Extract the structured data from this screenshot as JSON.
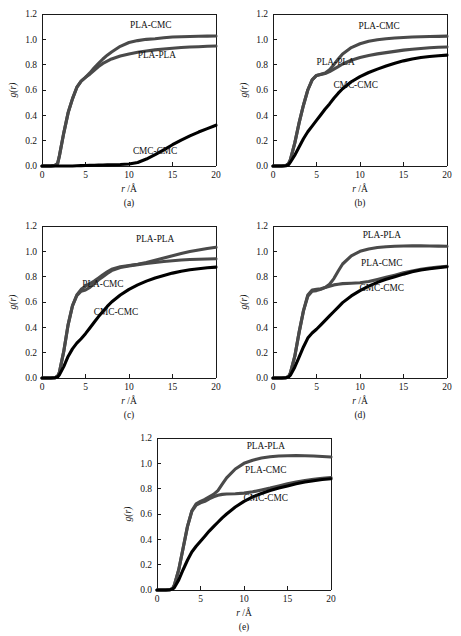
{
  "figure": {
    "axis_color": "#1a1a1a",
    "background": "#ffffff",
    "series_colors": {
      "PLA-PLA": "#4a4a4a",
      "PLA-CMC": "#4a4a4a",
      "CMC-CMC": "#000000"
    },
    "xlabel": "r /Å",
    "ylabel": "g(r)",
    "xticklabels": [
      "0",
      "5",
      "10",
      "15",
      "20"
    ],
    "yticklabels": [
      "0.0",
      "0.2",
      "0.4",
      "0.6",
      "0.8",
      "1.0",
      "1.2"
    ],
    "panel_labels": [
      "(a)",
      "(b)",
      "(c)",
      "(d)",
      "(e)"
    ]
  },
  "chart_data": [
    {
      "type": "line",
      "title": "(a)",
      "xlabel": "r /Å",
      "ylabel": "g(r)",
      "xlim": [
        0,
        20
      ],
      "ylim": [
        0,
        1.2
      ],
      "xticks": [
        0,
        5,
        10,
        15,
        20
      ],
      "yticks": [
        0.0,
        0.2,
        0.4,
        0.6,
        0.8,
        1.0,
        1.2
      ],
      "grid": false,
      "legend": "inline-annotations",
      "x": [
        0,
        1,
        1.5,
        1.8,
        2,
        2.5,
        3,
        3.5,
        4,
        4.5,
        5,
        5.5,
        6,
        6.5,
        7,
        7.5,
        8,
        9,
        10,
        11,
        12,
        13,
        14,
        15,
        16,
        17,
        18,
        19,
        20
      ],
      "series": [
        {
          "name": "PLA-CMC",
          "values": [
            0,
            0,
            0.005,
            0.02,
            0.08,
            0.26,
            0.42,
            0.53,
            0.62,
            0.67,
            0.7,
            0.735,
            0.775,
            0.81,
            0.845,
            0.875,
            0.9,
            0.945,
            0.975,
            0.99,
            1.0,
            1.005,
            1.012,
            1.018,
            1.02,
            1.022,
            1.024,
            1.025,
            1.026
          ],
          "label_at": [
            12.5,
            1.09
          ]
        },
        {
          "name": "PLA-PLA",
          "values": [
            0,
            0,
            0.005,
            0.02,
            0.08,
            0.26,
            0.42,
            0.53,
            0.62,
            0.67,
            0.7,
            0.725,
            0.755,
            0.785,
            0.81,
            0.828,
            0.845,
            0.868,
            0.885,
            0.898,
            0.908,
            0.917,
            0.924,
            0.93,
            0.935,
            0.939,
            0.942,
            0.945,
            0.947
          ],
          "label_at": [
            13.2,
            0.855
          ]
        },
        {
          "name": "CMC-CMC",
          "values": [
            0,
            0,
            0,
            0,
            0,
            0,
            0,
            0,
            0.002,
            0.003,
            0.004,
            0.005,
            0.006,
            0.007,
            0.008,
            0.009,
            0.01,
            0.012,
            0.016,
            0.028,
            0.055,
            0.09,
            0.128,
            0.168,
            0.205,
            0.238,
            0.268,
            0.295,
            0.322
          ],
          "label_at": [
            13.0,
            0.095
          ]
        }
      ]
    },
    {
      "type": "line",
      "title": "(b)",
      "xlabel": "r /Å",
      "ylabel": "g(r)",
      "xlim": [
        0,
        20
      ],
      "ylim": [
        0,
        1.2
      ],
      "xticks": [
        0,
        5,
        10,
        15,
        20
      ],
      "yticks": [
        0.0,
        0.2,
        0.4,
        0.6,
        0.8,
        1.0,
        1.2
      ],
      "grid": false,
      "legend": "inline-annotations",
      "x": [
        0,
        1,
        1.5,
        1.8,
        2,
        2.5,
        3,
        3.5,
        4,
        4.5,
        5,
        5.5,
        6,
        6.5,
        7,
        7.5,
        8,
        9,
        10,
        11,
        12,
        13,
        14,
        15,
        16,
        17,
        18,
        19,
        20
      ],
      "series": [
        {
          "name": "PLA-CMC",
          "values": [
            0,
            0,
            0.004,
            0.02,
            0.05,
            0.18,
            0.34,
            0.48,
            0.6,
            0.68,
            0.715,
            0.725,
            0.735,
            0.76,
            0.8,
            0.845,
            0.885,
            0.935,
            0.965,
            0.985,
            0.997,
            1.005,
            1.01,
            1.015,
            1.018,
            1.02,
            1.022,
            1.023,
            1.025
          ],
          "label_at": [
            12.2,
            1.085
          ]
        },
        {
          "name": "PLA-PLA",
          "values": [
            0,
            0,
            0.004,
            0.02,
            0.05,
            0.18,
            0.34,
            0.48,
            0.6,
            0.68,
            0.715,
            0.722,
            0.73,
            0.745,
            0.765,
            0.785,
            0.805,
            0.835,
            0.857,
            0.873,
            0.885,
            0.895,
            0.905,
            0.915,
            0.922,
            0.928,
            0.933,
            0.937,
            0.94
          ],
          "label_at": [
            7.2,
            0.8
          ]
        },
        {
          "name": "CMC-CMC",
          "values": [
            0,
            0,
            0.002,
            0.01,
            0.03,
            0.085,
            0.15,
            0.215,
            0.27,
            0.315,
            0.36,
            0.405,
            0.45,
            0.49,
            0.535,
            0.575,
            0.61,
            0.665,
            0.705,
            0.738,
            0.765,
            0.79,
            0.812,
            0.83,
            0.845,
            0.856,
            0.864,
            0.87,
            0.875
          ],
          "label_at": [
            9.5,
            0.615
          ]
        }
      ]
    },
    {
      "type": "line",
      "title": "(c)",
      "xlabel": "r /Å",
      "ylabel": "g(r)",
      "xlim": [
        0,
        20
      ],
      "ylim": [
        0,
        1.2
      ],
      "xticks": [
        0,
        5,
        10,
        15,
        20
      ],
      "yticks": [
        0.0,
        0.2,
        0.4,
        0.6,
        0.8,
        1.0,
        1.2
      ],
      "grid": false,
      "legend": "inline-annotations",
      "x": [
        0,
        1,
        1.5,
        1.8,
        2,
        2.5,
        3,
        3.5,
        4,
        4.5,
        5,
        5.5,
        6,
        6.5,
        7,
        7.5,
        8,
        9,
        10,
        11,
        12,
        13,
        14,
        15,
        16,
        17,
        18,
        19,
        20
      ],
      "series": [
        {
          "name": "PLA-PLA",
          "values": [
            0,
            0,
            0.003,
            0.015,
            0.045,
            0.21,
            0.42,
            0.57,
            0.655,
            0.7,
            0.725,
            0.745,
            0.765,
            0.79,
            0.815,
            0.838,
            0.858,
            0.878,
            0.888,
            0.898,
            0.912,
            0.93,
            0.948,
            0.965,
            0.982,
            0.998,
            1.01,
            1.022,
            1.032
          ],
          "label_at": [
            13.0,
            1.075
          ]
        },
        {
          "name": "PLA-CMC",
          "values": [
            0,
            0,
            0.003,
            0.015,
            0.045,
            0.21,
            0.42,
            0.57,
            0.65,
            0.685,
            0.695,
            0.715,
            0.745,
            0.775,
            0.8,
            0.825,
            0.848,
            0.872,
            0.885,
            0.895,
            0.905,
            0.912,
            0.92,
            0.926,
            0.932,
            0.936,
            0.938,
            0.94,
            0.942
          ],
          "label_at": [
            7.0,
            0.715
          ]
        },
        {
          "name": "CMC-CMC",
          "values": [
            0,
            0,
            0.002,
            0.008,
            0.025,
            0.09,
            0.17,
            0.23,
            0.275,
            0.31,
            0.35,
            0.395,
            0.44,
            0.485,
            0.525,
            0.565,
            0.6,
            0.655,
            0.7,
            0.735,
            0.765,
            0.79,
            0.81,
            0.828,
            0.843,
            0.855,
            0.863,
            0.87,
            0.875
          ],
          "label_at": [
            8.5,
            0.5
          ]
        }
      ]
    },
    {
      "type": "line",
      "title": "(d)",
      "xlabel": "r /Å",
      "ylabel": "g(r)",
      "xlim": [
        0,
        20
      ],
      "ylim": [
        0,
        1.2
      ],
      "xticks": [
        0,
        5,
        10,
        15,
        20
      ],
      "yticks": [
        0.0,
        0.2,
        0.4,
        0.6,
        0.8,
        1.0,
        1.2
      ],
      "grid": false,
      "legend": "inline-annotations",
      "x": [
        0,
        1,
        1.5,
        1.8,
        2,
        2.5,
        3,
        3.5,
        4,
        4.5,
        5,
        5.5,
        6,
        6.5,
        7,
        7.5,
        8,
        9,
        10,
        11,
        12,
        13,
        14,
        15,
        16,
        17,
        18,
        19,
        20
      ],
      "series": [
        {
          "name": "PLA-PLA",
          "values": [
            0,
            0,
            0.003,
            0.012,
            0.04,
            0.17,
            0.36,
            0.53,
            0.655,
            0.695,
            0.7,
            0.705,
            0.715,
            0.74,
            0.785,
            0.845,
            0.9,
            0.965,
            1.0,
            1.018,
            1.03,
            1.036,
            1.04,
            1.042,
            1.043,
            1.043,
            1.042,
            1.041,
            1.04
          ],
          "label_at": [
            12.5,
            1.105
          ]
        },
        {
          "name": "PLA-CMC",
          "values": [
            0,
            0,
            0.003,
            0.012,
            0.04,
            0.17,
            0.36,
            0.53,
            0.645,
            0.685,
            0.69,
            0.7,
            0.715,
            0.725,
            0.735,
            0.74,
            0.745,
            0.748,
            0.752,
            0.762,
            0.778,
            0.795,
            0.812,
            0.83,
            0.845,
            0.858,
            0.868,
            0.876,
            0.882
          ],
          "label_at": [
            12.5,
            0.885
          ]
        },
        {
          "name": "CMC-CMC",
          "values": [
            0,
            0,
            0.002,
            0.008,
            0.022,
            0.085,
            0.165,
            0.245,
            0.315,
            0.355,
            0.385,
            0.42,
            0.455,
            0.49,
            0.525,
            0.56,
            0.595,
            0.648,
            0.69,
            0.725,
            0.755,
            0.78,
            0.8,
            0.82,
            0.838,
            0.852,
            0.862,
            0.87,
            0.878
          ],
          "label_at": [
            12.5,
            0.685
          ]
        }
      ]
    },
    {
      "type": "line",
      "title": "(e)",
      "xlabel": "r /Å",
      "ylabel": "g(r)",
      "xlim": [
        0,
        20
      ],
      "ylim": [
        0,
        1.2
      ],
      "xticks": [
        0,
        5,
        10,
        15,
        20
      ],
      "yticks": [
        0.0,
        0.2,
        0.4,
        0.6,
        0.8,
        1.0,
        1.2
      ],
      "grid": false,
      "legend": "inline-annotations",
      "x": [
        0,
        1,
        1.5,
        1.8,
        2,
        2.5,
        3,
        3.5,
        4,
        4.5,
        5,
        5.5,
        6,
        6.5,
        7,
        7.5,
        8,
        9,
        10,
        11,
        12,
        13,
        14,
        15,
        16,
        17,
        18,
        19,
        20
      ],
      "series": [
        {
          "name": "PLA-PLA",
          "values": [
            0,
            0,
            0.003,
            0.012,
            0.04,
            0.16,
            0.33,
            0.5,
            0.625,
            0.68,
            0.7,
            0.715,
            0.735,
            0.755,
            0.785,
            0.835,
            0.885,
            0.955,
            1.0,
            1.025,
            1.042,
            1.052,
            1.058,
            1.06,
            1.062,
            1.06,
            1.058,
            1.054,
            1.05
          ],
          "label_at": [
            12.5,
            1.115
          ]
        },
        {
          "name": "PLA-CMC",
          "values": [
            0,
            0,
            0.003,
            0.012,
            0.04,
            0.16,
            0.33,
            0.5,
            0.62,
            0.67,
            0.688,
            0.7,
            0.72,
            0.735,
            0.748,
            0.755,
            0.758,
            0.76,
            0.765,
            0.775,
            0.79,
            0.805,
            0.822,
            0.838,
            0.852,
            0.865,
            0.875,
            0.882,
            0.888
          ],
          "label_at": [
            12.5,
            0.925
          ]
        },
        {
          "name": "CMC-CMC",
          "values": [
            0,
            0,
            0.002,
            0.008,
            0.02,
            0.08,
            0.16,
            0.235,
            0.3,
            0.345,
            0.385,
            0.425,
            0.465,
            0.5,
            0.535,
            0.57,
            0.6,
            0.655,
            0.7,
            0.735,
            0.762,
            0.785,
            0.805,
            0.822,
            0.838,
            0.852,
            0.863,
            0.872,
            0.878
          ],
          "label_at": [
            12.5,
            0.705
          ]
        }
      ]
    }
  ]
}
